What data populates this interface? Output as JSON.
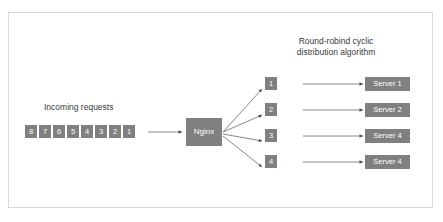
{
  "diagram": {
    "title_lines": [
      "Round-robind cyclic",
      "distribution algorithm"
    ],
    "incoming_label": "Incoming requests",
    "balancer_label": "Nginx",
    "incoming_queue": [
      "8",
      "7",
      "6",
      "5",
      "4",
      "3",
      "2",
      "1"
    ],
    "rows": [
      {
        "cells": [
          "5",
          "1"
        ],
        "server": "Server 1"
      },
      {
        "cells": [
          "6",
          "2"
        ],
        "server": "Server 2"
      },
      {
        "cells": [
          "7",
          "3"
        ],
        "server": "Server 4"
      },
      {
        "cells": [
          "8",
          "4"
        ],
        "server": "Server 4"
      }
    ],
    "colors": {
      "node_fill": "#808080",
      "node_text": "#ffffff",
      "label_text": "#3a3a3a",
      "connector": "#5a5a5a",
      "frame_border": "#d9d9d9",
      "background": "#ffffff"
    }
  }
}
